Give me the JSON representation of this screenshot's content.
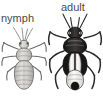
{
  "figure": {
    "background_color": "#ffffff",
    "width": 103,
    "height": 96,
    "style": "grayscale scientific line illustration"
  },
  "labels": {
    "nymph": "nymph",
    "adult": "adult",
    "text_color": "#4a4a4a"
  },
  "specimens": [
    {
      "name": "nymph",
      "label": "nymph",
      "description": "pale gray wingless immature bug with segmented abdomen, two antennae and six legs",
      "body_color": "#c9c7c4",
      "outline_color": "#6f6d6b",
      "has_wings": false,
      "legs": 6,
      "antennae": 2
    },
    {
      "name": "adult",
      "label": "adult",
      "description": "dark winged adult bug with black body, pale white wing membranes, long antennae and six legs",
      "body_color": "#1c1c1c",
      "wing_patch_color": "#f2f1ef",
      "outline_color": "#2a2a2a",
      "has_wings": true,
      "legs": 6,
      "antennae": 2
    }
  ]
}
